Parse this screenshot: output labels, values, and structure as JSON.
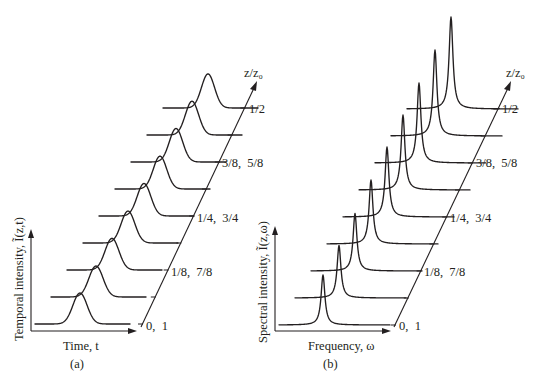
{
  "figure": {
    "panel_a": {
      "caption": "(a)",
      "x_axis_label": "Time, t",
      "y_axis_label": "Temporal intensity, Ĩ(z,t)",
      "z_axis_label": "z/z₀",
      "z_tick_labels": [
        "0,  1",
        "1/8,  7/8",
        "1/4,  3/4",
        "3/8,  5/8",
        "1/2"
      ]
    },
    "panel_b": {
      "caption": "(b)",
      "x_axis_label": "Frequency, ω",
      "y_axis_label": "Spectral intensity, Ĩ(z,ω)",
      "z_axis_label": "z/z₀",
      "z_tick_labels": [
        "0,  1",
        "1/8,  7/8",
        "1/4,  3/4",
        "3/8,  5/8",
        "1/2"
      ]
    }
  },
  "chart_data": [
    {
      "type": "line",
      "title": "(a)",
      "subtype": "waterfall",
      "xlabel": "Time, t",
      "ylabel": "Temporal intensity, Ĩ(z,t)",
      "zlabel": "z/z₀",
      "z_ticks": [
        0,
        0.0625,
        0.125,
        0.1875,
        0.25,
        0.3125,
        0.375,
        0.4375,
        0.5
      ],
      "z_tick_labels": [
        "0, 1",
        "",
        "1/8, 7/8",
        "",
        "1/4, 3/4",
        "",
        "3/8, 5/8",
        "",
        "1/2"
      ],
      "series_count": 9,
      "peak_shape": "gaussian-like, broad",
      "relative_peak_heights": [
        1.0,
        1.0,
        1.02,
        1.03,
        1.05,
        1.06,
        1.08,
        1.09,
        1.1
      ],
      "relative_width": [
        1.0,
        1.0,
        0.98,
        0.97,
        0.96,
        0.95,
        0.94,
        0.93,
        0.92
      ],
      "grid": false,
      "legend": null
    },
    {
      "type": "line",
      "title": "(b)",
      "subtype": "waterfall",
      "xlabel": "Frequency, ω",
      "ylabel": "Spectral intensity, Ĩ(z,ω)",
      "zlabel": "z/z₀",
      "z_ticks": [
        0,
        0.0625,
        0.125,
        0.1875,
        0.25,
        0.3125,
        0.375,
        0.4375,
        0.5
      ],
      "z_tick_labels": [
        "0, 1",
        "",
        "1/8, 7/8",
        "",
        "1/4, 3/4",
        "",
        "3/8, 5/8",
        "",
        "1/2"
      ],
      "series_count": 9,
      "peak_shape": "narrow, sharp (Lorentzian-like)",
      "relative_peak_heights": [
        1.0,
        1.05,
        1.15,
        1.28,
        1.4,
        1.5,
        1.6,
        1.72,
        1.84
      ],
      "grid": false,
      "legend": null
    }
  ]
}
